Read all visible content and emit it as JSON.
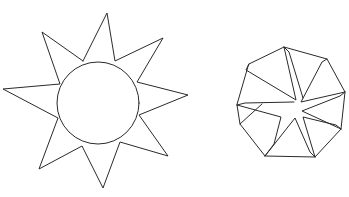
{
  "figure": {
    "background": "#ffffff",
    "stroke_color": "#2a2a2a",
    "shapes": [
      {
        "name": "sun",
        "description": "Circle with eight triangular rays",
        "circle": {
          "cx": 98,
          "cy": 103,
          "r": 41
        },
        "rays": [
          {
            "tip": [
              107,
              13
            ],
            "base": [
              [
                83,
                61
              ],
              [
                115,
                61
              ]
            ]
          },
          {
            "tip": [
              163,
              38
            ],
            "base": [
              [
                115,
                61
              ],
              [
                137,
                82
              ]
            ]
          },
          {
            "tip": [
              188,
              95
            ],
            "base": [
              [
                137,
                82
              ],
              [
                139,
                115
              ]
            ]
          },
          {
            "tip": [
              168,
              156
            ],
            "base": [
              [
                139,
                115
              ],
              [
                120,
                142
              ]
            ]
          },
          {
            "tip": [
              103,
              188
            ],
            "base": [
              [
                120,
                142
              ],
              [
                82,
                146
              ]
            ]
          },
          {
            "tip": [
              39,
              169
            ],
            "base": [
              [
                82,
                146
              ],
              [
                58,
                118
              ]
            ]
          },
          {
            "tip": [
              3,
              89
            ],
            "base": [
              [
                58,
                118
              ],
              [
                60,
                84
              ]
            ]
          },
          {
            "tip": [
              42,
              32
            ],
            "base": [
              [
                60,
                84
              ],
              [
                83,
                61
              ]
            ]
          }
        ]
      },
      {
        "name": "folded-octagon",
        "description": "Irregular octagon with folded triangular flaps forming a star in the center",
        "outline": [
          [
            249,
            64
          ],
          [
            284,
            47
          ],
          [
            327,
            59
          ],
          [
            345,
            92
          ],
          [
            341,
            129
          ],
          [
            315,
            157
          ],
          [
            265,
            156
          ],
          [
            240,
            124
          ],
          [
            237,
            105
          ]
        ],
        "center": [
          300,
          110
        ]
      }
    ]
  }
}
